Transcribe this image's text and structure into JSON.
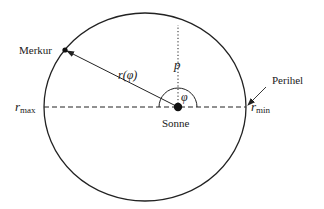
{
  "diagram": {
    "labels": {
      "planet": "Merkur",
      "sun": "Sonne",
      "perihelion": "Perihel",
      "radius": "r(φ)",
      "p": "p",
      "phi": "φ",
      "r_max_base": "r",
      "r_max_sub": "max",
      "r_min_base": "r",
      "r_min_sub": "min"
    },
    "colors": {
      "stroke": "#222222",
      "text": "#1a1a1a",
      "background": "#ffffff"
    }
  }
}
